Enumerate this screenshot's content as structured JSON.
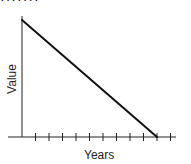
{
  "chart_data": {
    "type": "line",
    "title": "",
    "xlabel": "Years",
    "ylabel": "Value",
    "x_ticks_count": 11,
    "x_tick_labels": [],
    "y_tick_labels": [],
    "grid": false,
    "legend": null,
    "series": [
      {
        "name": "Value",
        "points": [
          {
            "x": 0,
            "y": 100
          },
          {
            "x": 10,
            "y": 0
          }
        ]
      }
    ],
    "annotations": [
      "straight-line decline from maximum value at year 0 to zero at the 10th tick"
    ],
    "xlim": [
      0,
      11
    ],
    "ylim": [
      0,
      100
    ]
  },
  "page": {
    "top_cut_text": "·······"
  },
  "colors": {
    "axis": "#222222",
    "line": "#111111",
    "background": "#ffffff"
  }
}
